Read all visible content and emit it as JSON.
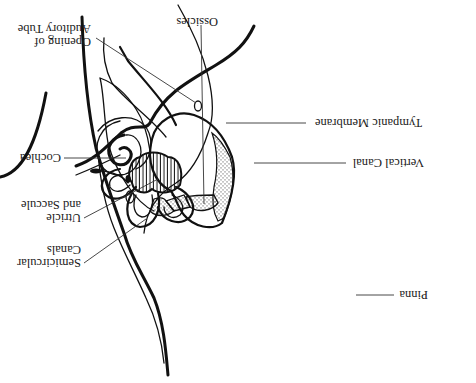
{
  "diagram": {
    "orientation": "upside-down",
    "colors": {
      "ink": "#111111",
      "background": "#ffffff",
      "label_text": "#1a1a1a"
    },
    "labels": {
      "ossicles": "Ossicles",
      "opening_line1": "Opening of",
      "opening_line2": "Auditory Tube",
      "cochlea": "Cochlea",
      "utricle_line1": "Utricle",
      "utricle_line2": "and Saccule",
      "semicircular_line1": "Semicircular",
      "semicircular_line2": "Canals",
      "tympanic": "Tympanic Membrane",
      "vertical_canal": "Vertical Canal",
      "pinna": "Pinna"
    }
  }
}
